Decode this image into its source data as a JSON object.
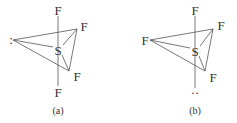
{
  "figure": {
    "panels": [
      {
        "id": "a",
        "caption": "(a)",
        "central_atom": "S",
        "axial_top": "F",
        "axial_bottom": "F",
        "equatorial_upper_right": "F",
        "equatorial_lower_right": "F",
        "equatorial_left": ":",
        "lone_pair_position": "equatorial"
      },
      {
        "id": "b",
        "caption": "(b)",
        "central_atom": "S",
        "axial_top": "F",
        "axial_bottom": "··",
        "equatorial_upper_right": "F",
        "equatorial_lower_right": "F",
        "equatorial_left": "F",
        "lone_pair_position": "axial"
      }
    ]
  }
}
